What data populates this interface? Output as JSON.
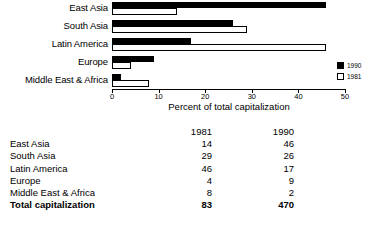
{
  "chart_data": {
    "type": "bar",
    "orientation": "horizontal",
    "title": "",
    "xlabel": "Percent of total capitalization",
    "ylabel": "",
    "xlim": [
      0,
      50
    ],
    "xticks": [
      0,
      10,
      20,
      30,
      40,
      50
    ],
    "xtick_labels": [
      "0",
      "10",
      "20",
      "30",
      "40",
      "50"
    ],
    "grid": false,
    "legend_position": "right",
    "categories": [
      "East Asia",
      "South Asia",
      "Latin America",
      "Europe",
      "Middle East & Africa"
    ],
    "series": [
      {
        "name": "1990",
        "color": "#000000",
        "fill": "solid",
        "values": [
          46,
          26,
          17,
          9,
          2
        ]
      },
      {
        "name": "1981",
        "color": "#ffffff",
        "fill": "outline",
        "values": [
          14,
          29,
          46,
          4,
          8
        ]
      }
    ],
    "legend": [
      {
        "label": "1990",
        "swatch": "filled"
      },
      {
        "label": "1981",
        "swatch": "empty"
      }
    ]
  },
  "table": {
    "columns": [
      "",
      "1981",
      "1990"
    ],
    "rows": [
      {
        "name": "East Asia",
        "v1981": "14",
        "v1990": "46",
        "bold": false
      },
      {
        "name": "South Asia",
        "v1981": "29",
        "v1990": "26",
        "bold": false
      },
      {
        "name": "Latin America",
        "v1981": "46",
        "v1990": "17",
        "bold": false
      },
      {
        "name": "Europe",
        "v1981": "4",
        "v1990": "9",
        "bold": false
      },
      {
        "name": "Middle East & Africa",
        "v1981": "8",
        "v1990": "2",
        "bold": false
      },
      {
        "name": "Total capitalization",
        "v1981": "83",
        "v1990": "470",
        "bold": true
      }
    ]
  },
  "colors": {
    "bar_1990": "#000000",
    "bar_1981": "#ffffff",
    "outline": "#000000",
    "background": "#ffffff",
    "text": "#000000"
  }
}
